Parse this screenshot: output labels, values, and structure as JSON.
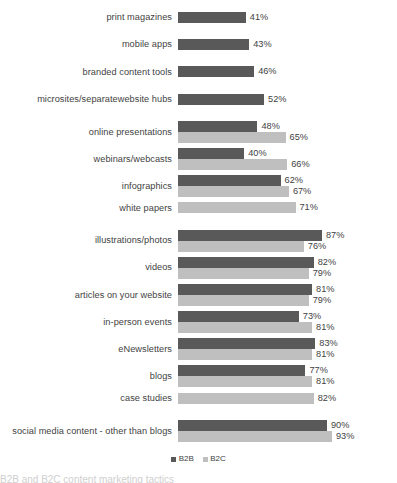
{
  "chart_data": {
    "type": "bar",
    "orientation": "horizontal",
    "title": "",
    "subtitle": "",
    "xlabel": "",
    "ylabel": "",
    "xlim": [
      0,
      100
    ],
    "grid": false,
    "value_suffix": "%",
    "legend_position": "bottom-center",
    "categories": [
      "print magazines",
      "mobile apps",
      "branded content tools",
      "microsites/separatewebsite hubs",
      "online presentations",
      "webinars/webcasts",
      "infographics",
      "white papers",
      "illustrations/photos",
      "videos",
      "articles on your website",
      "in-person events",
      "eNewsletters",
      "blogs",
      "case studies",
      "social media content - other than blogs"
    ],
    "series": [
      {
        "name": "B2B",
        "color": "#595959",
        "values": [
          41,
          43,
          46,
          52,
          48,
          40,
          62,
          null,
          87,
          82,
          81,
          73,
          83,
          77,
          null,
          90
        ]
      },
      {
        "name": "B2C",
        "color": "#bfbfbf",
        "values": [
          null,
          null,
          null,
          null,
          65,
          66,
          67,
          71,
          76,
          79,
          79,
          81,
          81,
          81,
          82,
          93
        ]
      }
    ],
    "rows": [
      {
        "label": "print magazines",
        "b2b": "41%",
        "b2c": null,
        "b2b_value": 41,
        "b2c_value": null
      },
      {
        "label": "mobile apps",
        "b2b": "43%",
        "b2c": null,
        "b2b_value": 43,
        "b2c_value": null
      },
      {
        "label": "branded content tools",
        "b2b": "46%",
        "b2c": null,
        "b2b_value": 46,
        "b2c_value": null
      },
      {
        "label": "microsites/separatewebsite hubs",
        "b2b": "52%",
        "b2c": null,
        "b2b_value": 52,
        "b2c_value": null
      },
      {
        "label": "online presentations",
        "b2b": "48%",
        "b2c": "65%",
        "b2b_value": 48,
        "b2c_value": 65
      },
      {
        "label": "webinars/webcasts",
        "b2b": "40%",
        "b2c": "66%",
        "b2b_value": 40,
        "b2c_value": 66
      },
      {
        "label": "infographics",
        "b2b": "62%",
        "b2c": "67%",
        "b2b_value": 62,
        "b2c_value": 67
      },
      {
        "label": "white papers",
        "b2b": null,
        "b2c": "71%",
        "b2b_value": null,
        "b2c_value": 71
      },
      {
        "label": "illustrations/photos",
        "b2b": "87%",
        "b2c": "76%",
        "b2b_value": 87,
        "b2c_value": 76
      },
      {
        "label": "videos",
        "b2b": "82%",
        "b2c": "79%",
        "b2b_value": 82,
        "b2c_value": 79
      },
      {
        "label": "articles on your website",
        "b2b": "81%",
        "b2c": "79%",
        "b2b_value": 81,
        "b2c_value": 79
      },
      {
        "label": "in-person events",
        "b2b": "73%",
        "b2c": "81%",
        "b2b_value": 73,
        "b2c_value": 81
      },
      {
        "label": "eNewsletters",
        "b2b": "83%",
        "b2c": "81%",
        "b2b_value": 83,
        "b2c_value": 81
      },
      {
        "label": "blogs",
        "b2b": "77%",
        "b2c": "81%",
        "b2b_value": 77,
        "b2c_value": 81
      },
      {
        "label": "case studies",
        "b2b": null,
        "b2c": "82%",
        "b2b_value": null,
        "b2c_value": 82
      },
      {
        "label": "social media content - other than blogs",
        "b2b": "90%",
        "b2c": "93%",
        "b2b_value": 90,
        "b2c_value": 93
      }
    ]
  },
  "legend": {
    "items": [
      {
        "label": "B2B",
        "color": "#595959"
      },
      {
        "label": "B2C",
        "color": "#bfbfbf"
      }
    ]
  },
  "caption": {
    "text": "B2B and B2C content marketing tactics"
  },
  "top_clip": {
    "text": ""
  },
  "render": {
    "px_per_percent": 1.655,
    "bar_origin_x": 186
  }
}
